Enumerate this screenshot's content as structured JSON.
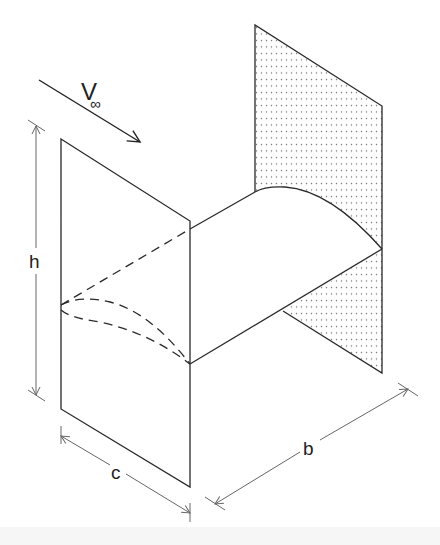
{
  "diagram": {
    "type": "wing-between-endplates",
    "labels": {
      "velocity": "V",
      "velocity_subscript": "∞",
      "height": "h",
      "chord": "c",
      "span": "b"
    },
    "colors": {
      "stroke": "#2a2a2a",
      "dimension": "#666666",
      "dots": "#777777",
      "background": "#ffffff"
    }
  }
}
